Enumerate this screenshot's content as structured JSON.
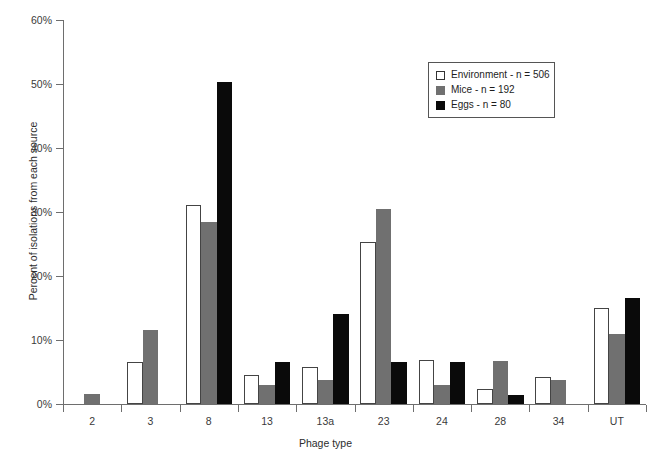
{
  "chart_data": {
    "type": "bar",
    "title": "",
    "xlabel": "Phage type",
    "ylabel": "Percent of isolations from each source",
    "categories": [
      "2",
      "3",
      "8",
      "13",
      "13a",
      "23",
      "24",
      "28",
      "34",
      "UT"
    ],
    "series": [
      {
        "name": "Environment - n = 506",
        "color": "#ffffff",
        "values": [
          0,
          6.5,
          31.1,
          4.5,
          5.8,
          25.3,
          6.8,
          2.3,
          4.2,
          15.0
        ]
      },
      {
        "name": "Mice - n = 192",
        "color": "#707070",
        "values": [
          1.5,
          11.5,
          28.5,
          3.0,
          3.7,
          30.5,
          2.9,
          6.7,
          3.8,
          11.0
        ]
      },
      {
        "name": "Eggs - n = 80",
        "color": "#0a0a0a",
        "values": [
          0,
          0,
          50.3,
          6.5,
          14.0,
          6.6,
          6.6,
          1.4,
          0,
          16.5
        ]
      }
    ],
    "ylim": [
      0,
      60
    ],
    "ytick_values": [
      0,
      10,
      20,
      30,
      40,
      50,
      60
    ],
    "ytick_labels": [
      "0%",
      "10%",
      "20%",
      "30%",
      "40%",
      "50%",
      "60%"
    ],
    "grid": false,
    "legend_position": "upper-right"
  },
  "legend": {
    "entries": [
      {
        "label": "Environment - n = 506",
        "swatch": "open-white-square"
      },
      {
        "label": "Mice - n = 192",
        "swatch": "filled-gray-square"
      },
      {
        "label": "Eggs - n = 80",
        "swatch": "filled-black-square"
      }
    ]
  },
  "caption": {
    "faint_bottom_line": ""
  }
}
